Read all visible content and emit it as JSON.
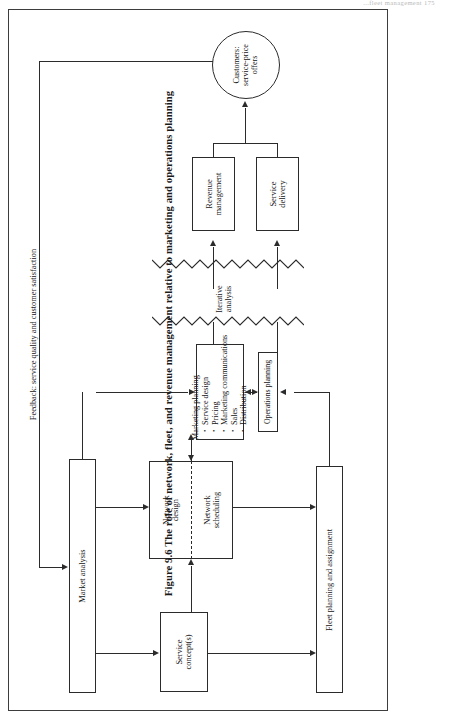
{
  "page": {
    "running_header": "...fleet management   175",
    "caption": "Figure 9.6  The role of network, fleet, and revenue management relative to marketing and operations planning"
  },
  "diagram": {
    "nodes": {
      "customers": {
        "label": "Customers:\nservice-price\noffers",
        "shape": "circle"
      },
      "revenue_management": {
        "label": "Revenue\nmanagement",
        "shape": "box"
      },
      "service_delivery": {
        "label": "Service\ndelivery",
        "shape": "box"
      },
      "marketing_planning": {
        "heading": "Marketing planning",
        "items": [
          "Service design",
          "Pricing",
          "Marketing communications",
          "Sales",
          "Distribution"
        ],
        "shape": "box"
      },
      "operations_planning": {
        "label": "Operations planning",
        "shape": "box"
      },
      "network_design": {
        "label": "Network\ndesign",
        "shape": "box"
      },
      "network_scheduling": {
        "label": "Network\nscheduling",
        "shape": "box"
      },
      "market_analysis": {
        "label": "Market analysis",
        "shape": "box"
      },
      "service_concepts": {
        "label": "Service\nconcept(s)",
        "shape": "box"
      },
      "fleet_planning": {
        "label": "Fleet planning and assignment",
        "shape": "box"
      }
    },
    "annotations": {
      "iterative_analysis": "Iterative\nanalysis",
      "feedback": "Feedback: service quality and customer satisfaction"
    }
  }
}
